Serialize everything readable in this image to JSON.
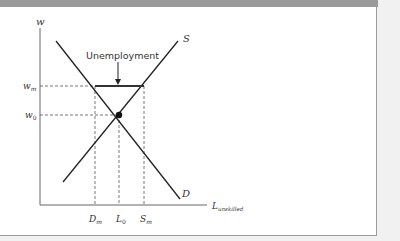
{
  "diagram": {
    "y_axis_label": "w",
    "x_axis_label_main": "L",
    "x_axis_label_sub": "unskilled",
    "y_ticks": [
      {
        "main": "w",
        "sub": "m"
      },
      {
        "main": "w",
        "sub": "0"
      }
    ],
    "x_ticks": [
      {
        "main": "D",
        "sub": "m"
      },
      {
        "main": "L",
        "sub": "0"
      },
      {
        "main": "S",
        "sub": "m"
      }
    ],
    "curves": {
      "supply_label": "S",
      "demand_label": "D"
    },
    "annotation": "Unemployment"
  },
  "colors": {
    "frame_bar": "#9a9a9a",
    "page_bg": "#f1f1f1",
    "line": "#222222"
  }
}
